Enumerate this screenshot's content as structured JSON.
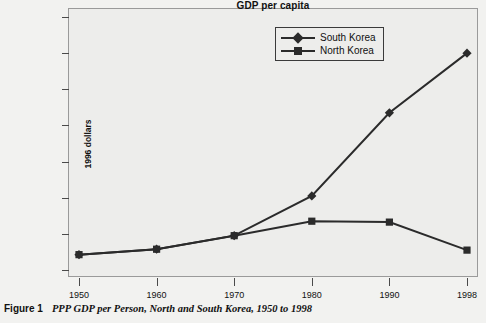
{
  "figure": {
    "caption_label": "Figure 1",
    "caption_text": "PPP GDP per Person, North and South Korea, 1950 to 1998"
  },
  "chart_data": {
    "type": "line",
    "title": "GDP per capita",
    "xlabel": "",
    "ylabel": "1996 dollars",
    "categories": [
      "1950",
      "1960",
      "1970",
      "1980",
      "1990",
      "1998"
    ],
    "series": [
      {
        "name": "South Korea",
        "marker": "diamond",
        "color": "#2b2b2b",
        "values": [
          850,
          1150,
          1900,
          4100,
          8700,
          12000
        ]
      },
      {
        "name": "North Korea",
        "marker": "square",
        "color": "#2b2b2b",
        "values": [
          850,
          1150,
          1900,
          2700,
          2650,
          1100
        ]
      }
    ],
    "ylim": [
      0,
      14000
    ],
    "yticks": [
      0,
      2000,
      4000,
      6000,
      8000,
      10000,
      12000,
      14000
    ],
    "ytick_labels": [
      "0",
      "2,000",
      "4,000",
      "6,000",
      "8,000",
      "10,000",
      "12,000",
      "14,000"
    ],
    "grid": false,
    "legend_position": "top-right-inside",
    "plot_background": "#ededeb"
  }
}
